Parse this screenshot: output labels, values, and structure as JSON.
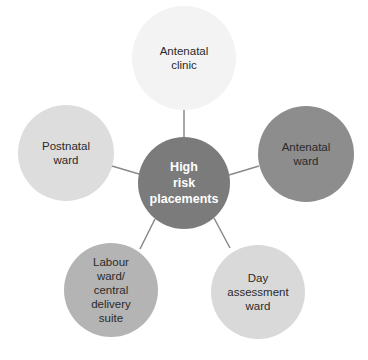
{
  "diagram": {
    "type": "hub-and-spoke",
    "center": {
      "label": "High\nrisk\nplacements",
      "color": "#7b7b7b",
      "text_color": "#ffffff"
    },
    "nodes": [
      {
        "id": "antenatal-clinic",
        "label": "Antenatal\nclinic",
        "color": "#f3f3f3"
      },
      {
        "id": "antenatal-ward",
        "label": "Antenatal\nward",
        "color": "#8d8d8d"
      },
      {
        "id": "day-assessment-ward",
        "label": "Day\nassessment\nward",
        "color": "#d9d9d9"
      },
      {
        "id": "labour-ward",
        "label": "Labour\nward/\ncentral\ndelivery\nsuite",
        "color": "#b4b4b4"
      },
      {
        "id": "postnatal-ward",
        "label": "Postnatal\nward",
        "color": "#dddddd"
      }
    ],
    "connector_color": "#8a8a8a"
  }
}
